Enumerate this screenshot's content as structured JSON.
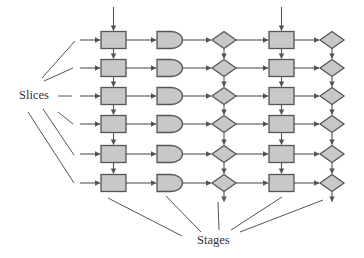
{
  "diagram": {
    "type": "pipeline-grid",
    "labels": {
      "slices": "Slices",
      "stages": "Stages"
    },
    "rows": 6,
    "row_centers_y": [
      40,
      68,
      96,
      124,
      154,
      183
    ],
    "columns": [
      {
        "shape": "rectangle",
        "center_x": 113.5,
        "vertical_links": true,
        "top_input": true,
        "bottom_output": false
      },
      {
        "shape": "and-gate",
        "center_x": 170,
        "vertical_links": false,
        "top_input": false,
        "bottom_output": false
      },
      {
        "shape": "diamond",
        "center_x": 224,
        "vertical_links": true,
        "top_input": false,
        "bottom_output": true
      },
      {
        "shape": "rectangle",
        "center_x": 281.5,
        "vertical_links": true,
        "top_input": true,
        "bottom_output": false
      },
      {
        "shape": "diamond",
        "center_x": 332,
        "vertical_links": true,
        "top_input": false,
        "bottom_output": true
      }
    ],
    "colors": {
      "node_fill": "#c8c8c8",
      "stroke": "#555555",
      "text": "#333333",
      "background": "#ffffff"
    }
  }
}
